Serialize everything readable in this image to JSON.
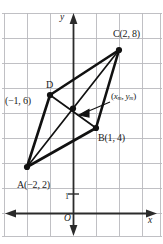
{
  "figure": {
    "background": "#ffffff",
    "grid": {
      "color": "#b9b9bd",
      "cell_px": 23,
      "visible": true
    },
    "axes": {
      "color": "#2b2b2b",
      "x_label": "x",
      "y_label": "y",
      "origin_label": "O",
      "tick_label": "1"
    },
    "shape": {
      "stroke": "#111111",
      "vertex_color": "#111111",
      "diagonal_stroke": "#111111"
    },
    "points": [
      {
        "name": "A",
        "label": "A(−2, 2)",
        "x": -2,
        "y": 2
      },
      {
        "name": "B",
        "label": "B(1, 4)",
        "x": 1,
        "y": 4
      },
      {
        "name": "C",
        "label": "C(2, 8)",
        "x": 2,
        "y": 8
      },
      {
        "name": "D",
        "label": "D",
        "label2": "(−1, 6)",
        "x": -1,
        "y": 6
      }
    ],
    "midpoint": {
      "name": "M",
      "label_x": "x",
      "label_x_sub": "m",
      "label_y": "y",
      "label_y_sub": "m",
      "label_full": "(x_m, y_m)"
    },
    "edges": [
      {
        "from": "A",
        "to": "D"
      },
      {
        "from": "D",
        "to": "C"
      },
      {
        "from": "C",
        "to": "B"
      },
      {
        "from": "B",
        "to": "A"
      }
    ],
    "diagonals": [
      {
        "from": "A",
        "to": "C"
      },
      {
        "from": "B",
        "to": "D"
      }
    ]
  }
}
